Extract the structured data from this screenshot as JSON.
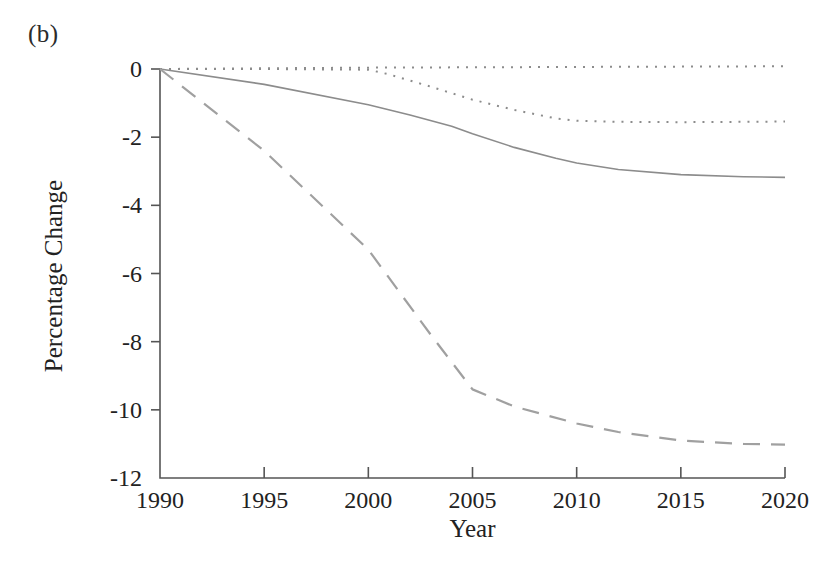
{
  "figure": {
    "panel_label": "(b)",
    "xlabel": "Year",
    "ylabel": "Percentage Change"
  },
  "chart_data": {
    "type": "line",
    "title": "",
    "subtitle": "",
    "panel": "(b)",
    "xlabel": "Year",
    "ylabel": "Percentage Change",
    "xlim": [
      1990,
      2020
    ],
    "ylim": [
      -12,
      0
    ],
    "xticks": [
      1990,
      1995,
      2000,
      2005,
      2010,
      2015,
      2020
    ],
    "yticks": [
      0,
      -2,
      -4,
      -6,
      -8,
      -10,
      -12
    ],
    "xtick_labels": [
      "1990",
      "1995",
      "2000",
      "2005",
      "2010",
      "2015",
      "2020"
    ],
    "ytick_labels": [
      "0",
      "-2",
      "-4",
      "-6",
      "-8",
      "-10",
      "-12"
    ],
    "grid": false,
    "legend": "none",
    "line_color": "#8c8c8c",
    "axis_color": "#555555",
    "series": [
      {
        "name": "flat-baseline-dotted",
        "style": "dotted",
        "color": "#8c8c8c",
        "width": 2.0,
        "dasharray": "2,7",
        "x": [
          1990,
          1995,
          2000,
          2005,
          2010,
          2015,
          2020
        ],
        "values": [
          0.0,
          0.02,
          0.04,
          0.05,
          0.06,
          0.07,
          0.08
        ]
      },
      {
        "name": "upper-dotted",
        "style": "dotted",
        "color": "#8c8c8c",
        "width": 2.0,
        "dasharray": "2,7",
        "x": [
          1990,
          1995,
          2000,
          2001,
          2003,
          2005,
          2007,
          2009,
          2010,
          2012,
          2015,
          2018,
          2020
        ],
        "values": [
          0.0,
          0.0,
          -0.02,
          -0.16,
          -0.52,
          -0.9,
          -1.2,
          -1.45,
          -1.52,
          -1.55,
          -1.56,
          -1.55,
          -1.54
        ]
      },
      {
        "name": "middle-solid",
        "style": "solid",
        "color": "#8c8c8c",
        "width": 1.6,
        "dasharray": "none",
        "x": [
          1990,
          1995,
          2000,
          2002,
          2004,
          2005,
          2007,
          2009,
          2010,
          2012,
          2015,
          2018,
          2020
        ],
        "values": [
          0.0,
          -0.45,
          -1.05,
          -1.35,
          -1.68,
          -1.9,
          -2.3,
          -2.62,
          -2.76,
          -2.95,
          -3.1,
          -3.16,
          -3.18
        ]
      },
      {
        "name": "lower-dashed",
        "style": "dashed",
        "color": "#a0a0a0",
        "width": 2.2,
        "dasharray": "17,11",
        "x": [
          1990,
          1995,
          2000,
          2003,
          2005,
          2007,
          2010,
          2012,
          2015,
          2018,
          2020
        ],
        "values": [
          0.0,
          -2.4,
          -5.3,
          -7.8,
          -9.4,
          -9.9,
          -10.4,
          -10.65,
          -10.9,
          -11.0,
          -11.02
        ]
      }
    ]
  }
}
